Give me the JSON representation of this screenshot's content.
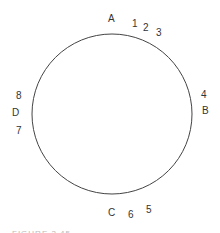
{
  "diagram": {
    "circle": {
      "cx": 112,
      "cy": 114,
      "r": 80,
      "stroke": "#444444"
    },
    "labels": [
      {
        "text": "A",
        "x": 108,
        "y": 14
      },
      {
        "text": "1",
        "x": 132,
        "y": 19
      },
      {
        "text": "2",
        "x": 143,
        "y": 23
      },
      {
        "text": "3",
        "x": 156,
        "y": 28
      },
      {
        "text": "4",
        "x": 201,
        "y": 90
      },
      {
        "text": "B",
        "x": 202,
        "y": 106
      },
      {
        "text": "5",
        "x": 146,
        "y": 205
      },
      {
        "text": "6",
        "x": 128,
        "y": 210
      },
      {
        "text": "C",
        "x": 108,
        "y": 208
      },
      {
        "text": "7",
        "x": 16,
        "y": 126
      },
      {
        "text": "D",
        "x": 12,
        "y": 108
      },
      {
        "text": "8",
        "x": 16,
        "y": 91
      }
    ],
    "caption": "FIGURE 3.45"
  }
}
